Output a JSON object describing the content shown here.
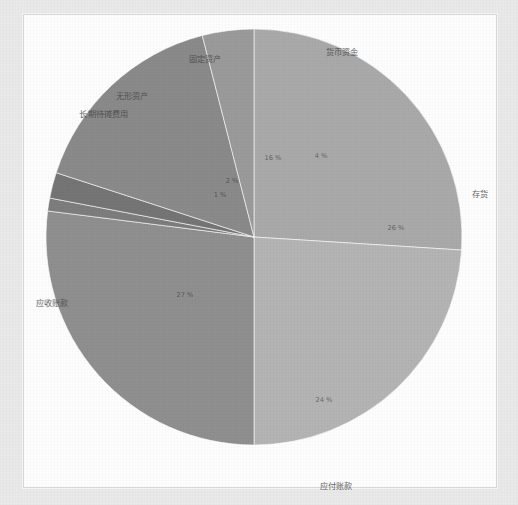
{
  "page": {
    "background_color": "#e9e9e9",
    "panel_color": "#fdfdfd"
  },
  "chart_data": {
    "type": "pie",
    "title": "公司资产表",
    "xlabel": "",
    "ylabel": "",
    "legend_position": "none",
    "grid": false,
    "start_angle_deg": 0,
    "direction": "clockwise",
    "categories": [
      "存货",
      "应付账款",
      "应收账款",
      "长期待摊费用",
      "无形资产",
      "固定资产",
      "货币资金"
    ],
    "values": [
      26,
      24,
      27,
      1,
      2,
      16,
      4
    ],
    "slices": [
      {
        "label": "存货",
        "percent_text": "26 %",
        "value": 26,
        "color": "#a9a9a9",
        "label_x": 456,
        "label_y": 178,
        "pct_x": 372,
        "pct_y": 213
      },
      {
        "label": "应付账款",
        "percent_text": "24 %",
        "value": 24,
        "color": "#b4b4b4",
        "label_x": 312,
        "label_y": 470,
        "pct_x": 300,
        "pct_y": 385
      },
      {
        "label": "应收账款",
        "percent_text": "27 %",
        "value": 27,
        "color": "#8f8f8f",
        "label_x": 28,
        "label_y": 287,
        "pct_x": 161,
        "pct_y": 280
      },
      {
        "label": "长期待摊费用",
        "percent_text": "1 %",
        "value": 1,
        "color": "#7d7d7d",
        "label_x": 80,
        "label_y": 98,
        "pct_x": 196,
        "pct_y": 180
      },
      {
        "label": "无形资产",
        "percent_text": "2 %",
        "value": 2,
        "color": "#757575",
        "label_x": 108,
        "label_y": 80,
        "pct_x": 208,
        "pct_y": 166
      },
      {
        "label": "固定资产",
        "percent_text": "16 %",
        "value": 16,
        "color": "#8a8a8a",
        "label_x": 181,
        "label_y": 43,
        "pct_x": 249,
        "pct_y": 143
      },
      {
        "label": "货币资金",
        "percent_text": "4 %",
        "value": 4,
        "color": "#9a9a9a",
        "label_x": 318,
        "label_y": 36,
        "pct_x": 297,
        "pct_y": 141
      }
    ]
  }
}
